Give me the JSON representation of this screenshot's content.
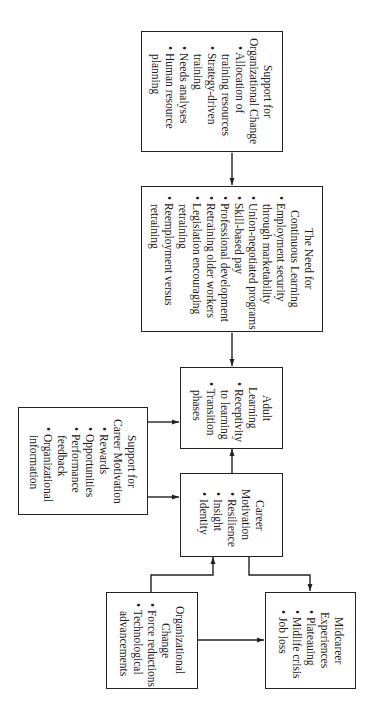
{
  "diagram": {
    "orientation": "rotated 90 degrees clockwise",
    "boxes": {
      "support_org_change": {
        "title": [
          "Support for",
          "Organizational Change"
        ],
        "items": [
          [
            "• Allocation of",
            "training resources"
          ],
          [
            "• Strategy-driven",
            "training"
          ],
          [
            "• Needs analyses"
          ],
          [
            "• Human resource",
            "planning"
          ]
        ]
      },
      "continuous_learning": {
        "title": [
          "The Need for",
          "Continuous Learning"
        ],
        "items": [
          [
            "• Employment security",
            "through marketability"
          ],
          [
            "• Union-negotiated programs"
          ],
          [
            "• Skill-based pay"
          ],
          [
            "• Professional development"
          ],
          [
            "• Retraining older workers"
          ],
          [
            "• Legislation encouraging",
            "retraining"
          ],
          [
            "• Reemployment versus",
            "retraining"
          ]
        ]
      },
      "adult_learning": {
        "title": [
          "Adult",
          "Learning"
        ],
        "items": [
          [
            "• Receptivity",
            "to learning"
          ],
          [
            "• Transition",
            "phases"
          ]
        ]
      },
      "support_career_motivation": {
        "title": [
          "Support for",
          "Career Motivation"
        ],
        "items": [
          [
            "• Rewards"
          ],
          [
            "• Opportunities"
          ],
          [
            "• Performance",
            "feedback"
          ],
          [
            "• Organizational",
            "information"
          ]
        ]
      },
      "career_motivation": {
        "title": [
          "Career",
          "Motivation"
        ],
        "items": [
          [
            "• Resilience"
          ],
          [
            "• Insight"
          ],
          [
            "• Identity"
          ]
        ]
      },
      "organizational_change": {
        "title": [
          "Organizational",
          "Change"
        ],
        "items": [
          [
            "• Force reductions"
          ],
          [
            "• Technological",
            "advancements"
          ]
        ]
      },
      "midcareer_experiences": {
        "title": [
          "Midcareer",
          "Experiences"
        ],
        "items": [
          [
            "• Plateauing"
          ],
          [
            "• Midlife crisis"
          ],
          [
            "• Job loss"
          ]
        ]
      }
    },
    "connections": [
      {
        "from": "support_org_change",
        "to": "continuous_learning",
        "type": "bidirectional"
      },
      {
        "from": "continuous_learning",
        "to": "adult_learning",
        "type": "bidirectional"
      },
      {
        "from": "support_career_motivation",
        "to": "adult_learning",
        "type": "arrow"
      },
      {
        "from": "support_career_motivation",
        "to": "career_motivation",
        "type": "arrow"
      },
      {
        "from": "career_motivation",
        "to": "adult_learning",
        "type": "arrow"
      },
      {
        "from": "organizational_change",
        "to": "career_motivation",
        "type": "arrow"
      },
      {
        "from": "career_motivation",
        "to": "midcareer_experiences",
        "type": "bidirectional"
      },
      {
        "from": "organizational_change",
        "to": "midcareer_experiences",
        "type": "arrow"
      }
    ]
  }
}
